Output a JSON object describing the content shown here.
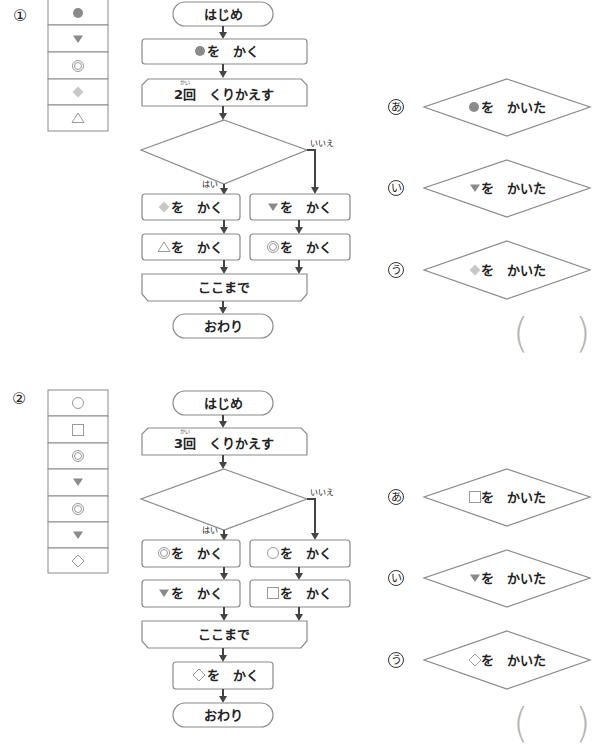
{
  "problems": [
    {
      "number": "①",
      "sequence": [
        "filled-circle",
        "down-triangle",
        "double-circle",
        "light-diamond",
        "outline-triangle"
      ],
      "flowchart": {
        "start": "はじめ",
        "step1": "を　かく",
        "step1_symbol": "filled-circle",
        "loop_start": "2回　くりかえす",
        "loop_count": "2",
        "loop_word": "くりかえす",
        "ruby": "かい",
        "yes_label": "はい",
        "no_label": "いいえ",
        "yes_branch": [
          {
            "symbol": "light-diamond",
            "text": "を　かく"
          },
          {
            "symbol": "outline-triangle",
            "text": "を　かく"
          }
        ],
        "no_branch": [
          {
            "symbol": "down-triangle",
            "text": "を　かく"
          },
          {
            "symbol": "double-circle",
            "text": "を　かく"
          }
        ],
        "loop_end": "ここまで",
        "end": "おわり"
      },
      "options": [
        {
          "label": "あ",
          "symbol": "filled-circle",
          "text": "を　かいた"
        },
        {
          "label": "い",
          "symbol": "down-triangle",
          "text": "を　かいた"
        },
        {
          "label": "う",
          "symbol": "light-diamond",
          "text": "を　かいた"
        }
      ],
      "answer": ""
    },
    {
      "number": "②",
      "sequence": [
        "outline-circle",
        "outline-square",
        "double-circle",
        "down-triangle",
        "double-circle",
        "down-triangle",
        "outline-diamond"
      ],
      "flowchart": {
        "start": "はじめ",
        "loop_start": "3回　くりかえす",
        "loop_count": "3",
        "loop_word": "くりかえす",
        "ruby": "かい",
        "yes_label": "はい",
        "no_label": "いいえ",
        "yes_branch": [
          {
            "symbol": "double-circle",
            "text": "を　かく"
          },
          {
            "symbol": "down-triangle",
            "text": "を　かく"
          }
        ],
        "no_branch": [
          {
            "symbol": "outline-circle",
            "text": "を　かく"
          },
          {
            "symbol": "outline-square",
            "text": "を　かく"
          }
        ],
        "loop_end": "ここまで",
        "after_loop": {
          "symbol": "outline-diamond",
          "text": "を　かく"
        },
        "end": "おわり"
      },
      "options": [
        {
          "label": "あ",
          "symbol": "outline-square",
          "text": "を　かいた"
        },
        {
          "label": "い",
          "symbol": "down-triangle",
          "text": "を　かいた"
        },
        {
          "label": "う",
          "symbol": "outline-diamond",
          "text": "を　かいた"
        }
      ],
      "answer": ""
    }
  ],
  "colors": {
    "stroke": "#8a8a8a",
    "arrow": "#444444",
    "symbol_gray": "#8a8a8a",
    "symbol_light": "#c8c8c8"
  }
}
